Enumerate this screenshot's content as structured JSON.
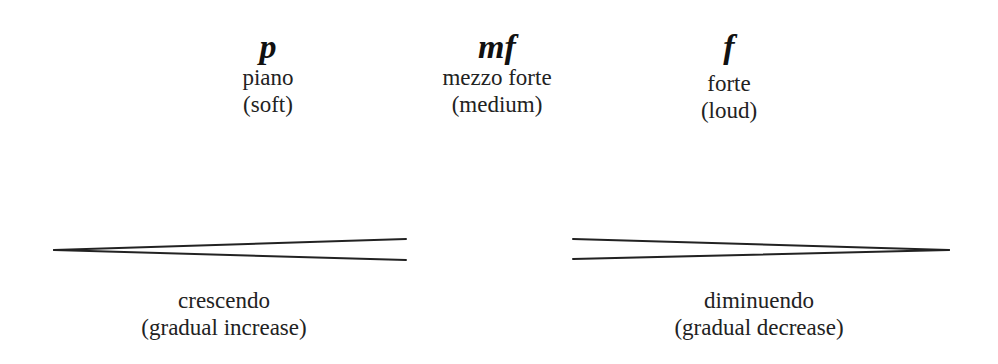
{
  "dynamics": [
    {
      "symbol": "p",
      "name": "piano",
      "meaning": "(soft)"
    },
    {
      "symbol": "mf",
      "name": "mezzo forte",
      "meaning": "(medium)"
    },
    {
      "symbol": "f",
      "name": "forte",
      "meaning": "(loud)"
    }
  ],
  "hairpins": [
    {
      "type": "crescendo",
      "name": "crescendo",
      "meaning": "(gradual increase)"
    },
    {
      "type": "diminuendo",
      "name": "diminuendo",
      "meaning": "(gradual decrease)"
    }
  ],
  "colors": {
    "ink": "#222222",
    "background": "#ffffff"
  }
}
